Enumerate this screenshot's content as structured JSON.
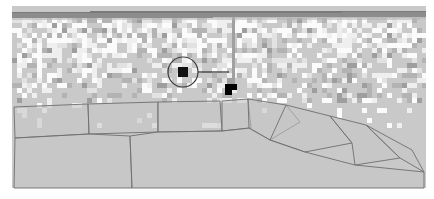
{
  "view": {
    "name": "aerial-parcel-map",
    "width": 434,
    "height": 199,
    "background_color": "#ffffff",
    "content_bounds": {
      "x": 12,
      "y": 6,
      "width": 414,
      "height": 182
    }
  },
  "palette": {
    "page_background": "#ffffff",
    "imagery_base": "#c9c9c9",
    "imagery_light": "#e2e2e2",
    "imagery_lighter": "#efefef",
    "imagery_white": "#fbfbfb",
    "imagery_dark": "#b3b3b3",
    "imagery_darker": "#9e9e9e",
    "road_primary": "#8c8c8c",
    "road_primary_shadow": "#7a7a7a",
    "road_secondary": "#a0a0a0",
    "parcel_stroke": "#6e6e6e",
    "parcel_fill": "#c4c4c4",
    "selection_stroke": "#3a3a3a",
    "marker_fill": "#111111",
    "leader_line": "#2b2b2b",
    "building_fill": "#000000"
  },
  "layers": [
    {
      "id": "imagery",
      "name": "Aerial imagery",
      "visible": true
    },
    {
      "id": "roads",
      "name": "Roads",
      "visible": true
    },
    {
      "id": "parcels",
      "name": "Parcel boundaries",
      "visible": true
    },
    {
      "id": "selection",
      "name": "Selected feature",
      "visible": true
    }
  ],
  "roads": {
    "horizontal": {
      "name": "horizontal-road",
      "x1": 12,
      "y1": 15,
      "x2": 426,
      "y2": 14,
      "width": 6,
      "color": "#8c8c8c",
      "shadow_color": "#7a7a7a"
    },
    "vertical": {
      "name": "vertical-road",
      "x1": 233,
      "y1": 17,
      "x2": 233,
      "y2": 85,
      "width": 3,
      "color": "#a0a0a0"
    }
  },
  "selection": {
    "circle": {
      "cx": 183,
      "cy": 72,
      "r": 15,
      "stroke": "#3a3a3a",
      "stroke_width": 1.2
    },
    "marker": {
      "x": 178,
      "y": 67,
      "width": 10,
      "height": 10,
      "fill": "#111111"
    },
    "leader_line": {
      "x1": 198,
      "y1": 72,
      "x2": 229,
      "y2": 72,
      "stroke": "#2b2b2b",
      "stroke_width": 1.2
    },
    "building": {
      "name": "selected-building-footprint",
      "fill": "#000000",
      "points": "225,84 237,84 237,90 232,90 232,95 225,95"
    }
  },
  "parcels": [
    {
      "id": "parcel-1",
      "points": "14,107 88,104 89,134 15,138"
    },
    {
      "id": "parcel-2",
      "points": "88,104 158,102 158,132 89,134"
    },
    {
      "id": "parcel-3",
      "points": "158,102 220,101 222,131 158,132"
    },
    {
      "id": "parcel-4",
      "points": "222,101 248,99 251,128 222,131"
    },
    {
      "id": "parcel-5",
      "points": "248,99 286,105 300,122 270,140 249,128"
    },
    {
      "id": "parcel-6",
      "points": "286,105 330,116 352,143 305,152 270,140"
    },
    {
      "id": "parcel-7",
      "points": "330,116 366,125 400,158 355,165 352,143"
    },
    {
      "id": "parcel-8",
      "points": "366,125 412,150 424,172 400,158"
    },
    {
      "id": "parcel-9",
      "points": "15,138 89,134 130,136 132,188 14,188"
    },
    {
      "id": "parcel-10",
      "points": "130,136 158,132 222,131 249,128 270,140 305,152 355,165 424,172 424,188 132,188"
    }
  ],
  "imagery_noise": {
    "description": "pixelated aerial texture, urban built-up area",
    "cell_size": 5,
    "columns": 84,
    "rows": 17,
    "band_top": 18,
    "band_bottom": 100,
    "seed": 20240513
  },
  "status": {
    "selected_feature_label": "",
    "scale_label": "",
    "coordinate_label": ""
  }
}
